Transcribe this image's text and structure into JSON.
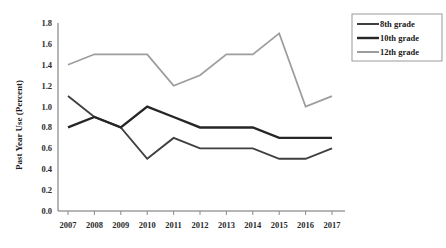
{
  "chart_data": {
    "type": "line",
    "title": "",
    "xlabel": "",
    "ylabel": "Past Year Use (Percent)",
    "categories": [
      "2007",
      "2008",
      "2009",
      "2010",
      "2011",
      "2012",
      "2013",
      "2014",
      "2015",
      "2016",
      "2017"
    ],
    "x": [
      2007,
      2008,
      2009,
      2010,
      2011,
      2012,
      2013,
      2014,
      2015,
      2016,
      2017
    ],
    "ylim": [
      0.0,
      1.8
    ],
    "yticks": [
      "0.0",
      "0.2",
      "0.4",
      "0.6",
      "0.8",
      "1.0",
      "1.2",
      "1.4",
      "1.6",
      "1.8"
    ],
    "ytick_values": [
      0.0,
      0.2,
      0.4,
      0.6,
      0.8,
      1.0,
      1.2,
      1.4,
      1.6,
      1.8
    ],
    "grid": false,
    "legend_position": "top-right",
    "series": [
      {
        "name": "8th grade",
        "color": "#3f3f3f",
        "width": 1.9,
        "values": [
          1.1,
          0.9,
          0.8,
          0.5,
          0.7,
          0.6,
          0.6,
          0.6,
          0.5,
          0.5,
          0.6
        ]
      },
      {
        "name": "10th grade",
        "color": "#262626",
        "width": 2.4,
        "values": [
          0.8,
          0.9,
          0.8,
          1.0,
          0.9,
          0.8,
          0.8,
          0.8,
          0.7,
          0.7,
          0.7
        ]
      },
      {
        "name": "12th grade",
        "color": "#9d9d9d",
        "width": 1.7,
        "values": [
          1.4,
          1.5,
          1.5,
          1.5,
          1.2,
          1.3,
          1.5,
          1.5,
          1.7,
          1.0,
          1.1
        ]
      }
    ]
  },
  "legend": {
    "items": [
      {
        "label": "8th grade"
      },
      {
        "label": "10th grade"
      },
      {
        "label": "12th grade"
      }
    ]
  },
  "axes": {
    "y_axis_title": "Past Year Use (Percent)"
  }
}
